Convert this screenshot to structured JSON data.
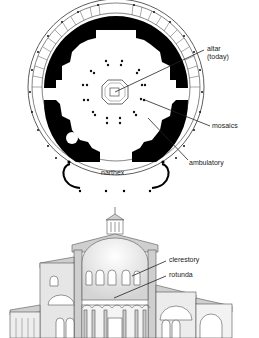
{
  "plan": {
    "labels": {
      "altar": "altar\n(today)",
      "mosaics": "mosaics",
      "ambulatory": "ambulatory",
      "narthex": "narthex"
    }
  },
  "section": {
    "labels": {
      "clerestory": "clerestory",
      "rotunda": "rotunda"
    }
  },
  "colors": {
    "wall": "#000000",
    "line": "#333333",
    "fill_gray": "#cfcfcf",
    "dome_gradient_top": "#ffffff",
    "dome_gradient_bottom": "#d8d8d8"
  }
}
